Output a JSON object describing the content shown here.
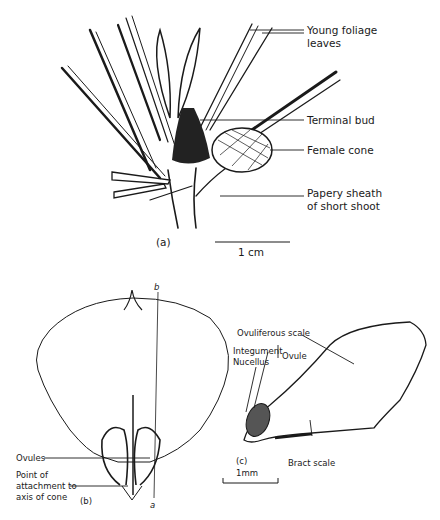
{
  "figure": {
    "panel_a": {
      "caption": "(a)",
      "labels": {
        "young_foliage_line1": "Young  foliage",
        "young_foliage_line2": "leaves",
        "terminal_bud": "Terminal bud",
        "female_cone": "Female cone",
        "papery_sheath_line1": "Papery sheath",
        "papery_sheath_line2": "of short shoot"
      },
      "scale_bar": "1 cm"
    },
    "panel_b": {
      "caption": "(b)",
      "axis_top": "b",
      "axis_bottom": "a",
      "labels": {
        "ovules": "Ovules",
        "attachment_line1": "Point of",
        "attachment_line2": "attachment to",
        "attachment_line3": "axis of cone"
      }
    },
    "panel_c": {
      "caption": "(c)",
      "labels": {
        "ovuliferous_scale": "Ovuliferous scale",
        "integument": "Integument",
        "nucellus": "Nucellus",
        "ovule": "Ovule",
        "bract_scale": "Bract scale"
      },
      "scale_bar": "1mm"
    },
    "colors": {
      "ink": "#1a1a1a",
      "background": "#ffffff",
      "ovule_fill": "#555555"
    }
  }
}
